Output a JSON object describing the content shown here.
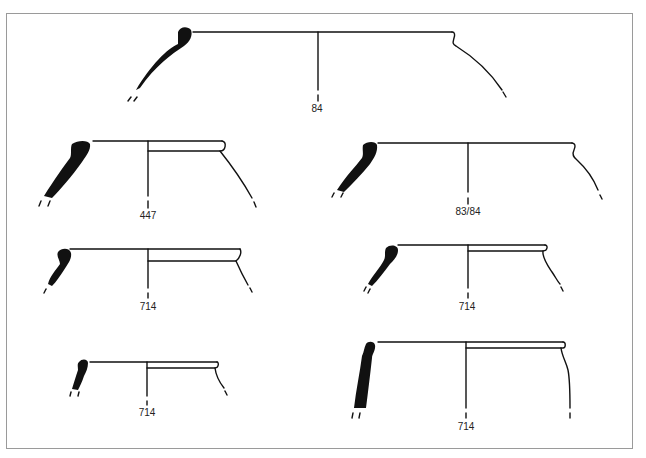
{
  "figure": {
    "type": "pottery rim profile drawings",
    "vessels": [
      {
        "id": "v1",
        "label": "84",
        "row": 1,
        "position": "center"
      },
      {
        "id": "v2",
        "label": "447",
        "row": 2,
        "position": "left"
      },
      {
        "id": "v3",
        "label": "83/84",
        "row": 2,
        "position": "right"
      },
      {
        "id": "v4",
        "label": "714",
        "row": 3,
        "position": "left"
      },
      {
        "id": "v5",
        "label": "714",
        "row": 3,
        "position": "right"
      },
      {
        "id": "v6",
        "label": "714",
        "row": 4,
        "position": "left"
      },
      {
        "id": "v7",
        "label": "714",
        "row": 4,
        "position": "right"
      }
    ]
  },
  "colors": {
    "ink": "#111111",
    "frame": "#9a9a9a",
    "background": "#ffffff"
  }
}
